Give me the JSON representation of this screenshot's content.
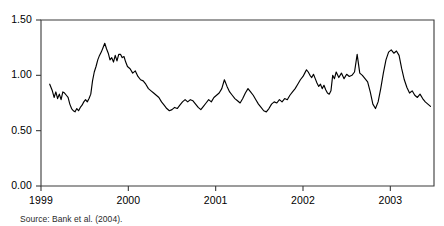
{
  "chart_data": {
    "type": "line",
    "title": "",
    "subtitle": "",
    "xlabel": "",
    "ylabel": "",
    "xlim": [
      1999.0,
      2003.5
    ],
    "ylim": [
      0.0,
      1.5
    ],
    "grid": false,
    "legend": null,
    "axis": {
      "x_ticks": [
        1999,
        2000,
        2001,
        2002,
        2003
      ],
      "x_tick_labels": [
        "1999",
        "2000",
        "2001",
        "2002",
        "2003"
      ],
      "y_ticks": [
        0.0,
        0.5,
        1.0,
        1.5
      ],
      "y_tick_labels": [
        "0.00",
        "0.50",
        "1.00",
        "1.50"
      ],
      "frame": "box",
      "line_color": "#000000",
      "line_width": 1.0
    },
    "series": [
      {
        "name": "series-1",
        "color": "#000000",
        "x": [
          1999.1,
          1999.13,
          1999.15,
          1999.17,
          1999.19,
          1999.21,
          1999.23,
          1999.25,
          1999.27,
          1999.29,
          1999.31,
          1999.33,
          1999.35,
          1999.37,
          1999.39,
          1999.41,
          1999.43,
          1999.45,
          1999.47,
          1999.49,
          1999.51,
          1999.53,
          1999.55,
          1999.57,
          1999.59,
          1999.61,
          1999.63,
          1999.65,
          1999.67,
          1999.69,
          1999.71,
          1999.73,
          1999.75,
          1999.77,
          1999.79,
          1999.81,
          1999.83,
          1999.85,
          1999.87,
          1999.89,
          1999.91,
          1999.93,
          1999.95,
          1999.97,
          1999.99,
          2000.02,
          2000.05,
          2000.08,
          2000.11,
          2000.14,
          2000.17,
          2000.2,
          2000.23,
          2000.26,
          2000.29,
          2000.32,
          2000.35,
          2000.38,
          2000.41,
          2000.44,
          2000.47,
          2000.5,
          2000.53,
          2000.56,
          2000.59,
          2000.62,
          2000.65,
          2000.68,
          2000.71,
          2000.74,
          2000.77,
          2000.8,
          2000.83,
          2000.86,
          2000.89,
          2000.92,
          2000.95,
          2000.98,
          2001.01,
          2001.04,
          2001.07,
          2001.1,
          2001.13,
          2001.16,
          2001.19,
          2001.22,
          2001.25,
          2001.28,
          2001.31,
          2001.34,
          2001.37,
          2001.4,
          2001.43,
          2001.46,
          2001.49,
          2001.52,
          2001.55,
          2001.58,
          2001.61,
          2001.64,
          2001.67,
          2001.7,
          2001.73,
          2001.76,
          2001.79,
          2001.82,
          2001.85,
          2001.88,
          2001.91,
          2001.94,
          2001.97,
          2002.0,
          2002.02,
          2002.04,
          2002.06,
          2002.08,
          2002.1,
          2002.12,
          2002.14,
          2002.16,
          2002.18,
          2002.2,
          2002.22,
          2002.24,
          2002.26,
          2002.28,
          2002.3,
          2002.32,
          2002.34,
          2002.36,
          2002.38,
          2002.41,
          2002.44,
          2002.47,
          2002.5,
          2002.53,
          2002.56,
          2002.59,
          2002.62,
          2002.65,
          2002.68,
          2002.71,
          2002.74,
          2002.77,
          2002.8,
          2002.83,
          2002.86,
          2002.89,
          2002.92,
          2002.95,
          2002.98,
          2003.01,
          2003.04,
          2003.07,
          2003.1,
          2003.13,
          2003.16,
          2003.19,
          2003.22,
          2003.25,
          2003.28,
          2003.31,
          2003.34,
          2003.37,
          2003.4,
          2003.43,
          2003.46
        ],
        "values": [
          0.92,
          0.86,
          0.8,
          0.85,
          0.79,
          0.83,
          0.78,
          0.85,
          0.84,
          0.82,
          0.8,
          0.74,
          0.7,
          0.68,
          0.67,
          0.7,
          0.68,
          0.71,
          0.73,
          0.76,
          0.78,
          0.76,
          0.79,
          0.83,
          0.95,
          1.03,
          1.08,
          1.14,
          1.18,
          1.21,
          1.25,
          1.29,
          1.24,
          1.2,
          1.14,
          1.16,
          1.12,
          1.18,
          1.13,
          1.19,
          1.19,
          1.16,
          1.17,
          1.12,
          1.08,
          1.06,
          1.02,
          1.04,
          0.99,
          0.96,
          0.95,
          0.92,
          0.88,
          0.86,
          0.84,
          0.82,
          0.8,
          0.76,
          0.73,
          0.7,
          0.68,
          0.69,
          0.71,
          0.7,
          0.73,
          0.76,
          0.78,
          0.76,
          0.78,
          0.77,
          0.74,
          0.71,
          0.69,
          0.72,
          0.75,
          0.78,
          0.76,
          0.8,
          0.82,
          0.84,
          0.88,
          0.96,
          0.9,
          0.85,
          0.82,
          0.79,
          0.77,
          0.75,
          0.79,
          0.84,
          0.88,
          0.85,
          0.82,
          0.78,
          0.74,
          0.71,
          0.68,
          0.67,
          0.7,
          0.74,
          0.76,
          0.75,
          0.78,
          0.76,
          0.79,
          0.78,
          0.82,
          0.85,
          0.88,
          0.92,
          0.96,
          0.99,
          1.02,
          1.05,
          1.03,
          1.0,
          0.98,
          1.01,
          0.97,
          0.93,
          0.9,
          0.92,
          0.88,
          0.91,
          0.87,
          0.84,
          0.83,
          0.86,
          1.0,
          0.97,
          1.03,
          0.98,
          1.02,
          0.97,
          1.01,
          0.99,
          1.0,
          1.03,
          1.19,
          1.02,
          1.0,
          0.97,
          0.94,
          0.85,
          0.74,
          0.7,
          0.76,
          0.88,
          1.02,
          1.14,
          1.21,
          1.23,
          1.2,
          1.22,
          1.18,
          1.06,
          0.96,
          0.89,
          0.84,
          0.86,
          0.82,
          0.8,
          0.83,
          0.79,
          0.76,
          0.74,
          0.72
        ]
      }
    ]
  },
  "caption": {
    "text": "Source: Bank et al. (2004)."
  }
}
